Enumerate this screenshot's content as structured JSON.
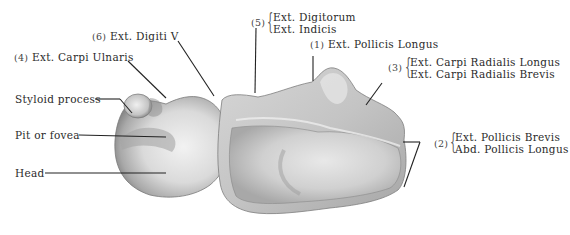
{
  "figure": {
    "labels": [
      {
        "id": "styloid",
        "text": "Styloid process"
      },
      {
        "id": "pit",
        "text": "Pit or fovea"
      },
      {
        "id": "head",
        "text": "Head"
      },
      {
        "id": "ext4",
        "number": "(4)",
        "text": "Ext. Carpi Ulnaris"
      },
      {
        "id": "ext6",
        "number": "(6)",
        "text": "Ext. Digiti V"
      },
      {
        "id": "ext5",
        "number": "(5)",
        "lines": [
          "Ext. Digitorum",
          "Ext. Indicis"
        ]
      },
      {
        "id": "ext1",
        "number": "(1)",
        "text": "Ext. Pollicis Longus"
      },
      {
        "id": "ext3",
        "number": "(3)",
        "lines": [
          "Ext. Carpi Radialis Longus",
          "Ext. Carpi Radialis Brevis"
        ]
      },
      {
        "id": "ext2",
        "number": "(2)",
        "lines": [
          "Ext. Pollicis Brevis",
          "Abd. Pollicis Longus"
        ]
      }
    ]
  },
  "colors": {
    "background": "#ffffff",
    "bone_light": "#e6e6e6",
    "bone_mid": "#bdbdbd",
    "bone_dark": "#7a7a7a",
    "leader": "#222222"
  }
}
